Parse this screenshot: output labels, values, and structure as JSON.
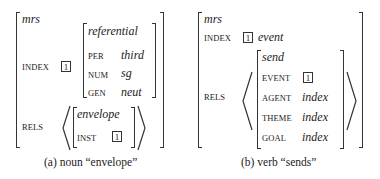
{
  "panel_a": {
    "type": "mrs",
    "index": {
      "label": "INDEX",
      "tag": "1",
      "avm": {
        "type": "referential",
        "features": [
          {
            "name": "PER",
            "value": "third"
          },
          {
            "name": "NUM",
            "value": "sg"
          },
          {
            "name": "GEN",
            "value": "neut"
          }
        ]
      }
    },
    "rels": {
      "label": "RELS",
      "items": [
        {
          "type": "envelope",
          "features": [
            {
              "name": "INST",
              "tag": "1"
            }
          ]
        }
      ]
    },
    "caption": "(a) noun “envelope”"
  },
  "panel_b": {
    "type": "mrs",
    "index": {
      "label": "INDEX",
      "tag": "1",
      "value": "event"
    },
    "rels": {
      "label": "RELS",
      "items": [
        {
          "type": "send",
          "features": [
            {
              "name": "EVENT",
              "tag": "1"
            },
            {
              "name": "AGENT",
              "value": "index"
            },
            {
              "name": "THEME",
              "value": "index"
            },
            {
              "name": "GOAL",
              "value": "index"
            }
          ]
        }
      ]
    },
    "caption": "(b) verb “sends”"
  }
}
